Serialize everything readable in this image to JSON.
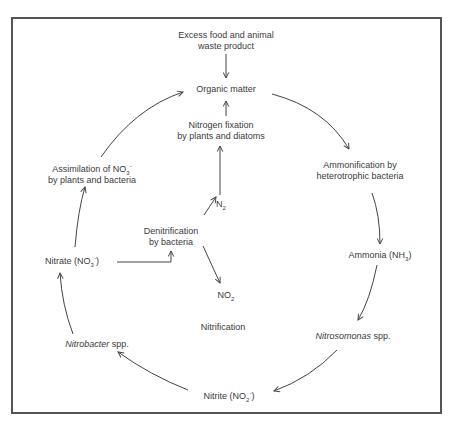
{
  "diagram": {
    "colors": {
      "stroke": "#444444",
      "text": "#3a3a3a",
      "border": "#555555",
      "background": "#ffffff"
    },
    "nodes": {
      "excess_food": {
        "line1": "Excess food and animal",
        "line2": "waste product"
      },
      "organic_matter": {
        "label": "Organic matter"
      },
      "nitrogen_fixation": {
        "line1": "Nitrogen fixation",
        "line2": "by plants and diatoms"
      },
      "ammonification": {
        "line1": "Ammonification by",
        "line2": "heterotrophic bacteria"
      },
      "ammonia": {
        "label": "Ammonia (NH",
        "sub": "3",
        "close": ")"
      },
      "nitrosomonas": {
        "italic": "Nitrosomonas",
        "rest": " spp."
      },
      "nitrite": {
        "label": "Nitrite (NO",
        "sub": "2",
        "sup": "-",
        "close": ")"
      },
      "nitrobacter": {
        "italic": "Nitrobacter",
        "rest": " spp."
      },
      "nitrate": {
        "label": "Nitrate (NO",
        "sub": "3",
        "sup": "-",
        "close": ")"
      },
      "assimilation": {
        "line1": "Assimilation of NO",
        "sub": "3",
        "sup": "-",
        "line2": "by plants and bacteria"
      },
      "denitrification": {
        "line1": "Denitrification",
        "line2": "by bacteria"
      },
      "n2": {
        "label": "N",
        "sub": "2"
      },
      "no2": {
        "label": "NO",
        "sub": "2"
      },
      "nitrification": {
        "label": "Nitrification"
      }
    },
    "edges": [
      {
        "from": "Excess food and animal waste product",
        "to": "Organic matter"
      },
      {
        "from": "Nitrogen fixation by plants and diatoms",
        "to": "Organic matter"
      },
      {
        "from": "N2",
        "to": "Nitrogen fixation by plants and diatoms"
      },
      {
        "from": "Organic matter",
        "to": "Ammonification by heterotrophic bacteria"
      },
      {
        "from": "Ammonification by heterotrophic bacteria",
        "to": "Ammonia (NH3)"
      },
      {
        "from": "Ammonia (NH3)",
        "to": "Nitrosomonas spp."
      },
      {
        "from": "Nitrosomonas spp.",
        "to": "Nitrite (NO2-)"
      },
      {
        "from": "Nitrite (NO2-)",
        "to": "Nitrobacter spp."
      },
      {
        "from": "Nitrobacter spp.",
        "to": "Nitrate (NO3-)"
      },
      {
        "from": "Nitrate (NO3-)",
        "to": "Assimilation of NO3- by plants and bacteria"
      },
      {
        "from": "Assimilation of NO3- by plants and bacteria",
        "to": "Organic matter"
      },
      {
        "from": "Nitrate (NO3-)",
        "to": "Denitrification by bacteria"
      },
      {
        "from": "Denitrification by bacteria",
        "to": "N2"
      },
      {
        "from": "Denitrification by bacteria",
        "to": "NO2"
      }
    ]
  }
}
